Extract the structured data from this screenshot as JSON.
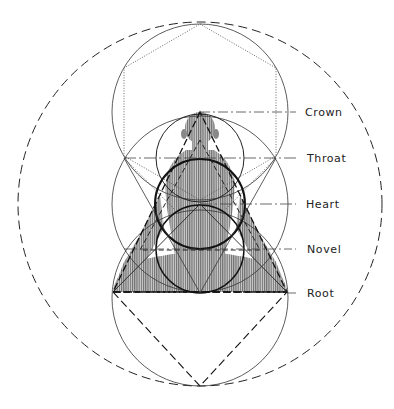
{
  "diagram": {
    "type": "sacred-geometry chakra diagram",
    "figure": "seated meditating figure (hatched drawing)",
    "colors": {
      "line": "#222222",
      "hatch": "#555555",
      "hatch_fill": "#b8b8b8",
      "background": "#ffffff"
    },
    "labels": [
      {
        "id": "crown",
        "text": "Crown",
        "y": 112
      },
      {
        "id": "throat",
        "text": "Throat",
        "y": 158
      },
      {
        "id": "heart",
        "text": "Heart",
        "y": 204
      },
      {
        "id": "navel",
        "text": "Novel",
        "y": 249
      },
      {
        "id": "root",
        "text": "Root",
        "y": 293
      }
    ]
  }
}
